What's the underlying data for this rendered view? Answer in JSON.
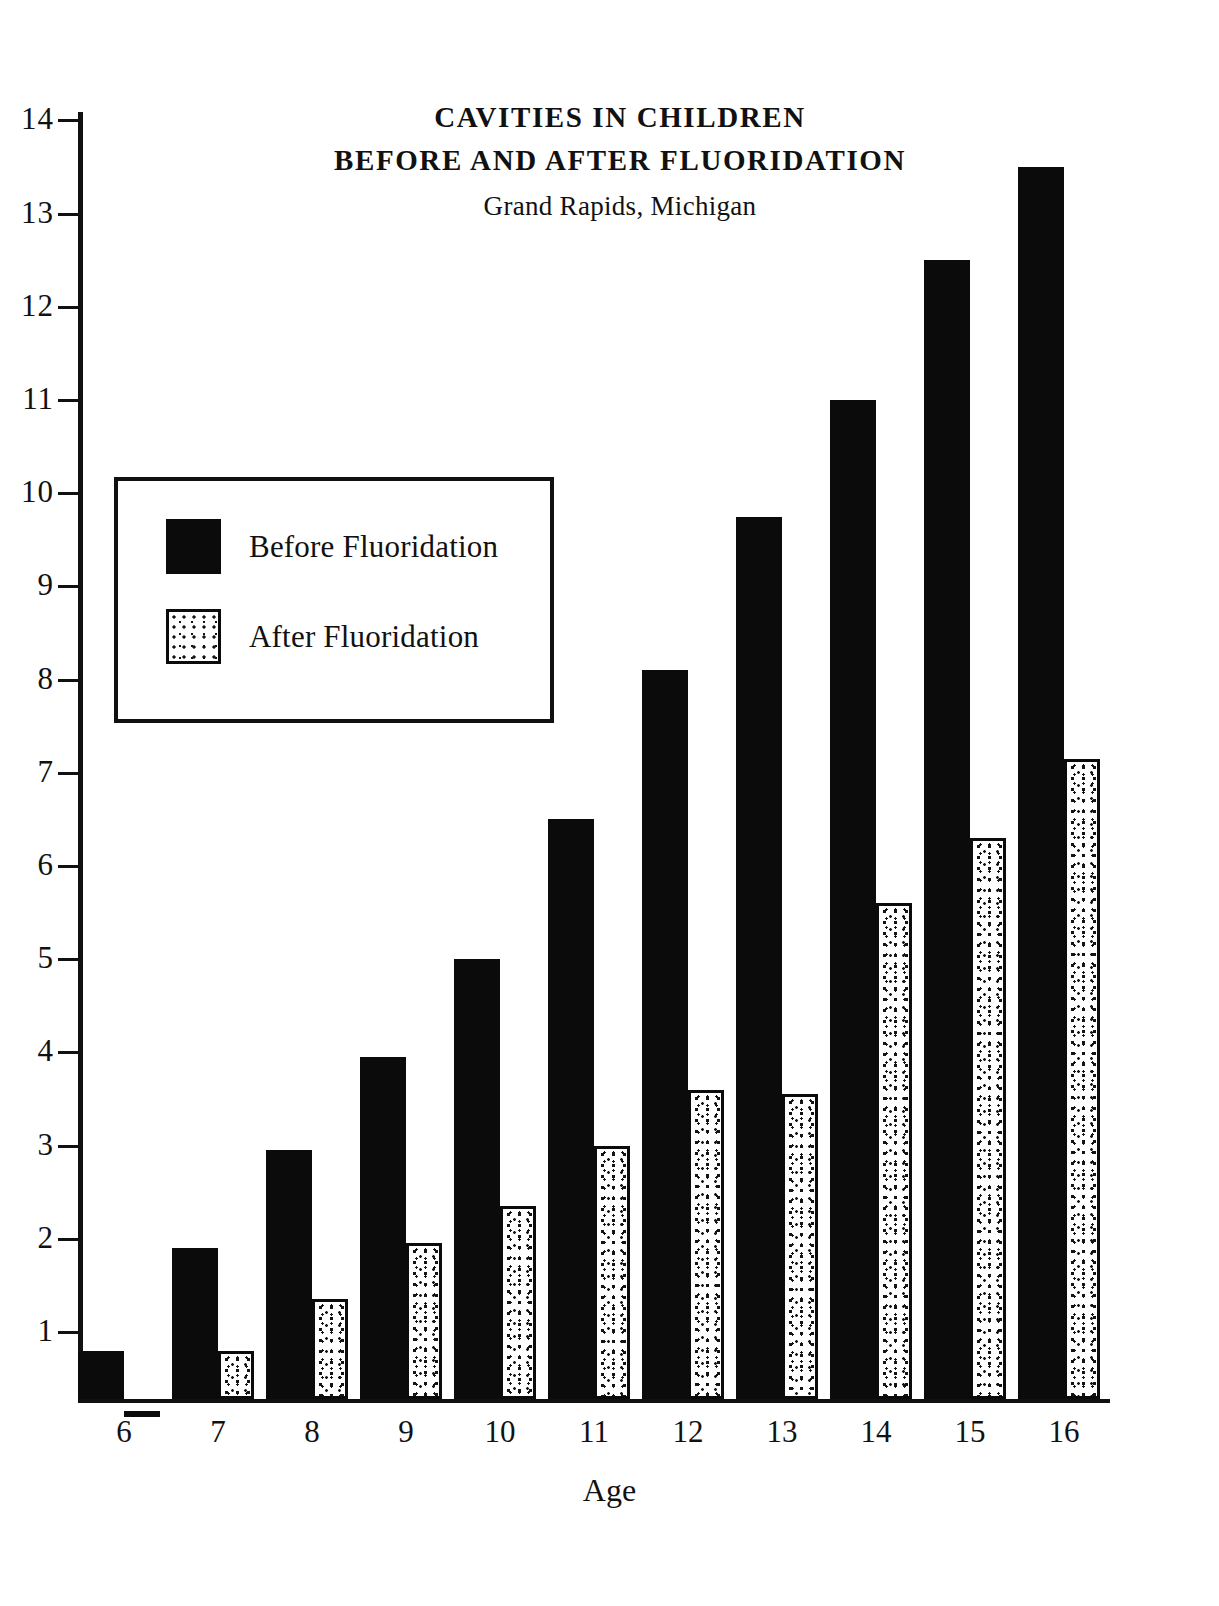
{
  "chart_data": {
    "type": "bar",
    "title": "CAVITIES IN CHILDREN BEFORE AND AFTER FLUORIDATION",
    "title_lines": [
      "CAVITIES IN CHILDREN",
      "BEFORE AND AFTER FLUORIDATION",
      "Grand Rapids, Michigan"
    ],
    "subtitle": "Grand Rapids, Michigan",
    "xlabel": "Age",
    "ylabel": "",
    "categories": [
      "6",
      "7",
      "8",
      "9",
      "10",
      "11",
      "12",
      "13",
      "14",
      "15",
      "16"
    ],
    "series": [
      {
        "name": "Before Fluoridation",
        "color": "#0b0b0b",
        "pattern": "solid",
        "values": [
          0.8,
          1.9,
          2.95,
          3.95,
          5.0,
          6.5,
          8.1,
          9.75,
          11.0,
          12.5,
          13.5
        ]
      },
      {
        "name": "After Fluoridation",
        "color": "#ffffff",
        "pattern": "stipple",
        "values": [
          0.15,
          0.8,
          1.35,
          1.95,
          2.35,
          3.0,
          3.6,
          3.55,
          5.6,
          6.3,
          7.15
        ]
      }
    ],
    "ylim": [
      0,
      14
    ],
    "yticks": [
      1,
      2,
      3,
      4,
      5,
      6,
      7,
      8,
      9,
      10,
      11,
      12,
      13,
      14
    ],
    "ytick_labels": [
      "1",
      "2",
      "3",
      "4",
      "5",
      "6",
      "7",
      "8",
      "9",
      "10",
      "11",
      "12",
      "13",
      "14"
    ],
    "grid": false,
    "legend_position": "upper-left",
    "legend_entries": [
      "Before Fluoridation",
      "After Fluoridation"
    ]
  },
  "legend": {
    "before_label": "Before Fluoridation",
    "after_label": "After Fluoridation"
  },
  "axis": {
    "x_title": "Age"
  }
}
